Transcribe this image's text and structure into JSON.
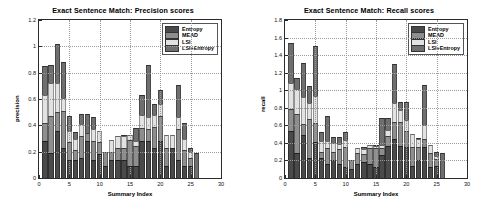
{
  "charts": {
    "left": {
      "title": "Exact Sentence Match: Precision scores",
      "xlabel": "Summary Index",
      "ylabel": "precision"
    },
    "right": {
      "title": "Exact Sentence Match: Recall scores",
      "xlabel": "Summary Index",
      "ylabel": "recall"
    }
  },
  "legend": {
    "items": [
      {
        "label": "Entropy",
        "color": "#4a4a4a"
      },
      {
        "label": "MEAD",
        "color": "#8e8e8e"
      },
      {
        "label": "LSI",
        "color": "#e2e2e2"
      },
      {
        "label": "LSI+Entropy",
        "color": "#6f6f6f"
      }
    ]
  },
  "chart_data": [
    {
      "type": "bar",
      "stacked": true,
      "title": "Exact Sentence Match: Precision scores",
      "xlabel": "Summary Index",
      "ylabel": "precision",
      "xlim": [
        0,
        30
      ],
      "ylim": [
        0,
        1.2
      ],
      "xticks": [
        0,
        5,
        10,
        15,
        20,
        25,
        30
      ],
      "yticks": [
        0,
        0.2,
        0.4,
        0.6,
        0.8,
        1,
        1.2
      ],
      "grid": true,
      "legend_position": "top-right",
      "x": [
        1,
        2,
        3,
        4,
        5,
        6,
        7,
        8,
        9,
        10,
        11,
        12,
        13,
        14,
        15,
        16,
        17,
        18,
        19,
        20,
        21,
        22,
        23,
        24,
        25,
        26
      ],
      "series": [
        {
          "name": "Entropy",
          "values": [
            0.28,
            0.19,
            0.36,
            0.23,
            0.14,
            0.14,
            0.15,
            0.28,
            0.14,
            0.18,
            0.09,
            0.14,
            0.14,
            0.14,
            0.09,
            0.09,
            0.28,
            0.28,
            0.23,
            0.28,
            0.09,
            0.23,
            0.14,
            0.09,
            0.09,
            0.0
          ]
        },
        {
          "name": "MEAD",
          "values": [
            0.14,
            0.28,
            0.14,
            0.28,
            0.13,
            0.07,
            0.17,
            0.06,
            0.14,
            0.09,
            0.11,
            0.06,
            0.09,
            0.09,
            0.2,
            0.15,
            0.1,
            0.09,
            0.16,
            0.19,
            0.14,
            0.0,
            0.23,
            0.12,
            0.06,
            0.0
          ]
        },
        {
          "name": "LSI",
          "values": [
            0.21,
            0.25,
            0.22,
            0.1,
            0.09,
            0.09,
            0.09,
            0.0,
            0.09,
            0.09,
            0.0,
            0.09,
            0.09,
            0.09,
            0.04,
            0.04,
            0.1,
            0.09,
            0.09,
            0.09,
            0.1,
            0.1,
            0.09,
            0.09,
            0.05,
            0.0
          ]
        },
        {
          "name": "LSI+Entropy",
          "values": [
            0.22,
            0.14,
            0.3,
            0.27,
            0.11,
            0.05,
            0.08,
            0.15,
            0.09,
            0.0,
            0.0,
            0.0,
            0.0,
            0.01,
            0.0,
            0.1,
            0.15,
            0.4,
            0.08,
            0.11,
            0.0,
            0.0,
            0.25,
            0.12,
            0.03,
            0.19
          ]
        }
      ]
    },
    {
      "type": "bar",
      "stacked": true,
      "title": "Exact Sentence Match: Recall scores",
      "xlabel": "Summary Index",
      "ylabel": "recall",
      "xlim": [
        0,
        30
      ],
      "ylim": [
        0,
        1.8
      ],
      "xticks": [
        0,
        5,
        10,
        15,
        20,
        25,
        30
      ],
      "yticks": [
        0,
        0.2,
        0.4,
        0.6,
        0.8,
        1,
        1.2,
        1.4,
        1.6,
        1.8
      ],
      "grid": true,
      "legend_position": "top-right",
      "x": [
        1,
        2,
        3,
        4,
        5,
        6,
        7,
        8,
        9,
        10,
        11,
        12,
        13,
        14,
        15,
        16,
        17,
        18,
        19,
        20,
        21,
        22,
        23,
        24,
        25,
        26
      ],
      "series": [
        {
          "name": "Entropy",
          "values": [
            0.54,
            0.28,
            0.49,
            0.23,
            0.41,
            0.23,
            0.16,
            0.21,
            0.16,
            0.13,
            0.1,
            0.16,
            0.18,
            0.16,
            0.12,
            0.26,
            0.36,
            0.45,
            0.36,
            0.35,
            0.14,
            0.2,
            0.35,
            0.13,
            0.14,
            0.0
          ]
        },
        {
          "name": "MEAD",
          "values": [
            0.25,
            0.45,
            0.12,
            0.44,
            0.22,
            0.07,
            0.18,
            0.09,
            0.17,
            0.22,
            0.1,
            0.13,
            0.09,
            0.18,
            0.22,
            0.08,
            0.12,
            0.19,
            0.28,
            0.18,
            0.21,
            0.15,
            0.1,
            0.16,
            0.08,
            0.0
          ]
        },
        {
          "name": "LSI",
          "values": [
            0.29,
            0.28,
            0.31,
            0.19,
            0.3,
            0.12,
            0.08,
            0.1,
            0.06,
            0.08,
            0.0,
            0.05,
            0.06,
            0.04,
            0.03,
            0.04,
            0.07,
            0.22,
            0.14,
            0.13,
            0.15,
            0.1,
            0.15,
            0.09,
            0.03,
            0.0
          ]
        },
        {
          "name": "LSI+Entropy",
          "values": [
            0.46,
            0.13,
            0.39,
            0.19,
            0.57,
            0.11,
            0.29,
            0.07,
            0.08,
            0.09,
            0.0,
            0.0,
            0.02,
            0.0,
            0.01,
            0.3,
            0.13,
            0.44,
            0.09,
            0.21,
            0.0,
            0.01,
            0.46,
            0.0,
            0.05,
            0.29
          ]
        }
      ]
    }
  ]
}
